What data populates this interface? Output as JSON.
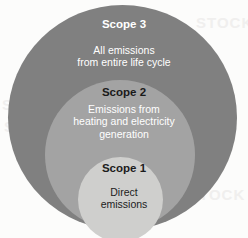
{
  "diagram": {
    "type": "concentric-circles",
    "background_color": "#fcfcfb",
    "rings": [
      {
        "id": "scope3",
        "heading": "Scope 3",
        "body_lines": [
          "All emissions",
          "from entire life cycle"
        ],
        "fill_color": "#808080",
        "heading_color": "#ffffff",
        "body_color": "#ffffff",
        "level": 3
      },
      {
        "id": "scope2",
        "heading": "Scope 2",
        "body_lines": [
          "Emissions from",
          "heating and electricity",
          "generation"
        ],
        "fill_color": "#a3a3a3",
        "heading_color": "#1a1a1a",
        "body_color": "#ffffff",
        "level": 2
      },
      {
        "id": "scope1",
        "heading": "Scope 1",
        "body_lines": [
          "Direct",
          "emissions"
        ],
        "fill_color": "#cfcfcd",
        "heading_color": "#1c1c1c",
        "body_color": "#1c1c1c",
        "level": 1
      }
    ],
    "watermark_text": "STOCK"
  }
}
